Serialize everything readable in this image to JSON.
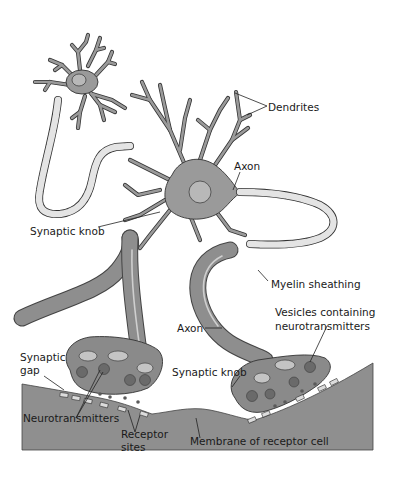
{
  "diagram": {
    "colors": {
      "background": "#ffffff",
      "cell_fill": "#9a9a9a",
      "membrane_fill": "#8f8f8f",
      "myelin_fill": "#e4e4e4",
      "outline": "#333333",
      "label_text": "#1a1a1a"
    },
    "labels": {
      "dendrites": "Dendrites",
      "axon_top": "Axon",
      "synaptic_knob_top": "Synaptic knob",
      "myelin_sheathing": "Myelin sheathing",
      "vesicles_line1": "Vesicles containing",
      "vesicles_line2": "neurotransmitters",
      "axon_bottom": "Axon",
      "synaptic_gap_line1": "Synaptic",
      "synaptic_gap_line2": "gap",
      "synaptic_knob_bottom": "Synaptic knob",
      "neurotransmitters": "Neurotransmitters",
      "receptor_sites_line1": "Receptor",
      "receptor_sites_line2": "sites",
      "membrane_of_receptor_cell": "Membrane of receptor cell"
    }
  }
}
